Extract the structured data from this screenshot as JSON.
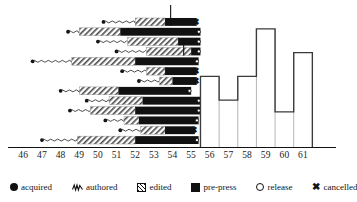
{
  "chart_data": {
    "type": "bar",
    "title": "",
    "xlabel": "",
    "ylabel": "",
    "xlim": [
      45.5,
      62.5
    ],
    "grid": false,
    "legend_position": "bottom",
    "categories": [
      "46",
      "47",
      "48",
      "49",
      "50",
      "51",
      "52",
      "53",
      "54",
      "55",
      "56",
      "57",
      "58",
      "59",
      "60",
      "61"
    ],
    "tick_values": [
      46,
      47,
      48,
      49,
      50,
      51,
      52,
      53,
      54,
      55,
      56,
      57,
      58,
      59,
      60,
      61
    ],
    "phases": [
      {
        "key": "acquired",
        "label": "acquired",
        "symbol": "filled-circle",
        "color": "#111111"
      },
      {
        "key": "authored",
        "label": "authored",
        "symbol": "wavy-line",
        "color": "#333333"
      },
      {
        "key": "edited",
        "label": "edited",
        "symbol": "hatched-bar",
        "color": "#b8b8b8"
      },
      {
        "key": "pre-press",
        "label": "pre-press",
        "symbol": "solid-black-bar",
        "color": "#111111"
      },
      {
        "key": "release",
        "label": "release",
        "symbol": "open-circle",
        "color": "#ffffff"
      },
      {
        "key": "cancelled",
        "label": "cancelled",
        "symbol": "x-mark",
        "color": "#111111"
      }
    ],
    "projects": [
      {
        "row": 1,
        "acquired": 50.3,
        "authored_end": 52.0,
        "edited_end": 53.6,
        "prepress_end": 55.3,
        "end_marker": "cancelled",
        "tick_above": 53.9
      },
      {
        "row": 2,
        "acquired": 48.4,
        "authored_end": 49.0,
        "edited_end": 51.2,
        "prepress_end": 55.5,
        "end_marker": "release"
      },
      {
        "row": 3,
        "acquired": 50.0,
        "authored_end": 51.6,
        "edited_end": 54.3,
        "prepress_end": 55.5,
        "end_marker": "release"
      },
      {
        "row": 4,
        "acquired": 51.0,
        "authored_end": 52.6,
        "edited_end": 55.0,
        "prepress_end": 55.5,
        "end_marker": "release",
        "tick_above": 54.6
      },
      {
        "row": 5,
        "acquired": 46.5,
        "authored_end": 48.6,
        "edited_end": 52.0,
        "prepress_end": 55.4,
        "end_marker": "release"
      },
      {
        "row": 6,
        "acquired": 51.3,
        "authored_end": 52.6,
        "edited_end": 53.6,
        "prepress_end": 55.3,
        "end_marker": "cancelled"
      },
      {
        "row": 7,
        "acquired": 52.2,
        "authored_end": 53.3,
        "edited_end": 54.0,
        "prepress_end": 55.3,
        "end_marker": "cancelled"
      },
      {
        "row": 8,
        "acquired": 48.0,
        "authored_end": 49.0,
        "edited_end": 51.1,
        "prepress_end": 55.0,
        "end_marker": "release"
      },
      {
        "row": 9,
        "acquired": 49.4,
        "authored_end": 50.6,
        "edited_end": 52.4,
        "prepress_end": 55.5,
        "end_marker": "release"
      },
      {
        "row": 10,
        "acquired": 48.5,
        "authored_end": 49.6,
        "edited_end": 52.0,
        "prepress_end": 55.5,
        "end_marker": "release"
      },
      {
        "row": 11,
        "acquired": 50.4,
        "authored_end": 51.4,
        "edited_end": 52.2,
        "prepress_end": 55.4,
        "end_marker": "release"
      },
      {
        "row": 12,
        "acquired": 51.2,
        "authored_end": 52.3,
        "edited_end": 53.6,
        "prepress_end": 55.2,
        "end_marker": "cancelled"
      },
      {
        "row": 13,
        "acquired": 47.0,
        "authored_end": 48.9,
        "edited_end": 52.0,
        "prepress_end": 55.4,
        "end_marker": "release"
      }
    ],
    "release_histogram": {
      "label": "release",
      "categories": [
        "56",
        "57",
        "58",
        "59",
        "60",
        "61"
      ],
      "values": [
        6,
        4,
        6,
        10,
        3,
        8
      ],
      "ylim": [
        0,
        11
      ]
    }
  },
  "legend": {
    "items": [
      {
        "label": "acquired",
        "icon": "filled-circle-icon"
      },
      {
        "label": "authored",
        "icon": "wavy-line-icon"
      },
      {
        "label": "edited",
        "icon": "hatched-square-icon"
      },
      {
        "label": "pre-press",
        "icon": "black-square-icon"
      },
      {
        "label": "release",
        "icon": "open-circle-icon"
      },
      {
        "label": "cancelled",
        "icon": "x-mark-icon"
      }
    ]
  }
}
